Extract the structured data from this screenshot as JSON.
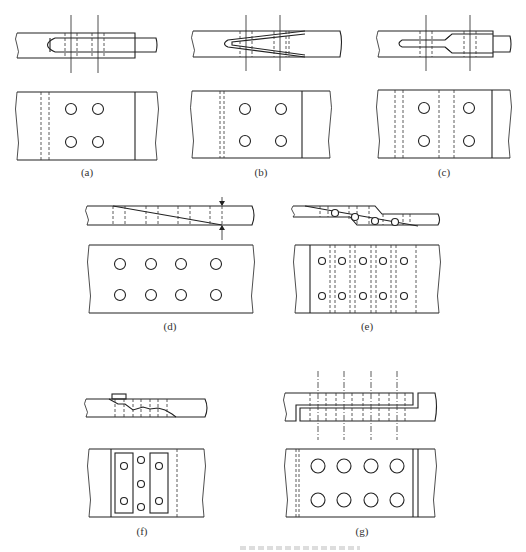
{
  "figure": {
    "panels": [
      {
        "id": "a",
        "label": "(a)",
        "top_view_holes": 4,
        "side_view": "slot-and-tongue lap splice with two bolt lines"
      },
      {
        "id": "b",
        "label": "(b)",
        "top_view_holes": 4,
        "side_view": "V-wedge (tapered) splice with two bolt lines"
      },
      {
        "id": "c",
        "label": "(c)",
        "top_view_holes": 4,
        "side_view": "stepped tongue splice with two bolt lines"
      },
      {
        "id": "d",
        "label": "(d)",
        "top_view_holes": 8,
        "side_view": "scarf (diagonal) splice with thickness arrows"
      },
      {
        "id": "e",
        "label": "(e)",
        "top_view_holes": 10,
        "side_view": "stepped scarf splice with bolts along joint"
      },
      {
        "id": "f",
        "label": "(f)",
        "top_view_holes": 7,
        "side_view": "irregular splice with cover plates"
      },
      {
        "id": "g",
        "label": "(g)",
        "top_view_holes": 8,
        "side_view": "hooked lap splice with four center lines"
      }
    ]
  }
}
